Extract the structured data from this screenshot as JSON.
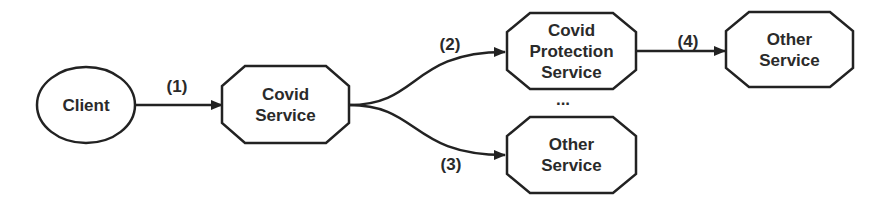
{
  "diagram": {
    "type": "flow",
    "nodes": [
      {
        "id": "client",
        "shape": "ellipse",
        "label": "Client"
      },
      {
        "id": "covid-service",
        "shape": "octagon",
        "label": "Covid\nService"
      },
      {
        "id": "covid-protection-service",
        "shape": "octagon",
        "label": "Covid\nProtection\nService"
      },
      {
        "id": "other-service-bottom",
        "shape": "octagon",
        "label": "Other\nService"
      },
      {
        "id": "other-service-right",
        "shape": "octagon",
        "label": "Other\nService"
      }
    ],
    "edges": [
      {
        "from": "client",
        "to": "covid-service",
        "label": "(1)"
      },
      {
        "from": "covid-service",
        "to": "covid-protection-service",
        "label": "(2)"
      },
      {
        "from": "covid-service",
        "to": "other-service-bottom",
        "label": "(3)"
      },
      {
        "from": "covid-protection-service",
        "to": "other-service-right",
        "label": "(4)"
      }
    ],
    "ellipsis": "...",
    "colors": {
      "stroke": "#222222",
      "fill": "#ffffff",
      "text": "#2a2a2a"
    }
  }
}
